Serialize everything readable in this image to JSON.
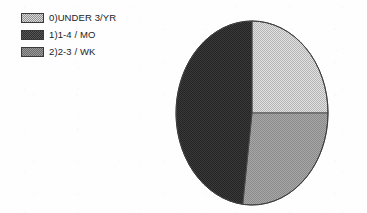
{
  "canvas": {
    "width": 367,
    "height": 213,
    "background": "#fefefe"
  },
  "legend": {
    "position": "top-left",
    "items": [
      {
        "label": "0)UNDER 3/YR",
        "swatch": "light-gray-dither",
        "color": "#d8d8d8"
      },
      {
        "label": "1)1-4 / MO",
        "swatch": "dark-gray-dither",
        "color": "#2e2e2e"
      },
      {
        "label": "2)2-3 / WK",
        "swatch": "mid-gray-dither",
        "color": "#9a9a9a"
      }
    ]
  },
  "chart_data": {
    "type": "pie",
    "title": "",
    "subtitle": "",
    "xlabel": "",
    "ylabel": "",
    "grid": false,
    "legend_position": "top-left",
    "start_angle_deg": 0,
    "direction": "clockwise",
    "center": {
      "cx": 252,
      "cy": 113
    },
    "radius": {
      "rx": 76,
      "ry": 92
    },
    "categories": [
      "0)UNDER 3/YR",
      "1)1-4 / MO",
      "2)2-3 / WK"
    ],
    "values": [
      25,
      48,
      27
    ],
    "value_unit": "percent",
    "slices": [
      {
        "index": 0,
        "label": "0)UNDER 3/YR",
        "value": 25,
        "percent": 25,
        "start_angle_deg": 0,
        "end_angle_deg": 90,
        "color": "#d8d8d8",
        "fill": "light-gray-dither"
      },
      {
        "index": 2,
        "label": "2)2-3 / WK",
        "value": 27,
        "percent": 27,
        "start_angle_deg": 90,
        "end_angle_deg": 187,
        "color": "#9a9a9a",
        "fill": "mid-gray-dither"
      },
      {
        "index": 1,
        "label": "1)1-4 / MO",
        "value": 48,
        "percent": 48,
        "start_angle_deg": 187,
        "end_angle_deg": 360,
        "color": "#2e2e2e",
        "fill": "dark-gray-dither"
      }
    ]
  }
}
